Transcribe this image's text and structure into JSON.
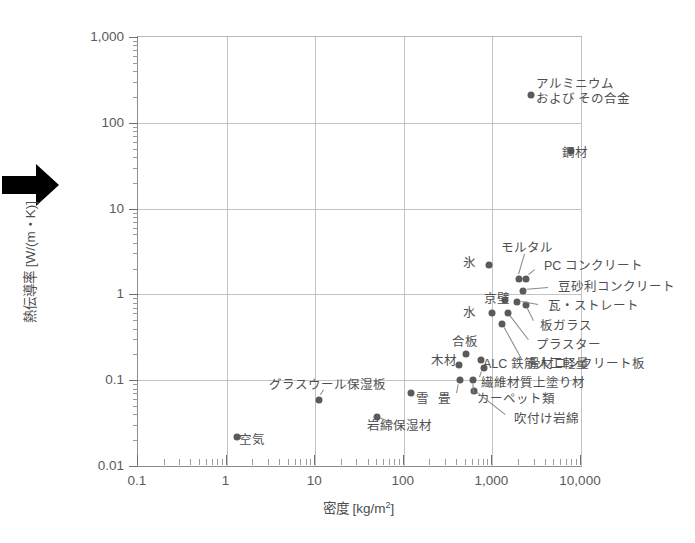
{
  "figure": {
    "arrow_icon": "right-arrow-marker"
  },
  "chart_data": {
    "type": "scatter",
    "title": "",
    "xlabel": "密度 [kg/m2]",
    "xlabel_base": "密度 [kg/m",
    "xlabel_sup": "2",
    "xlabel_tail": "]",
    "ylabel": "熱伝導率 [W/(m・K)]",
    "xscale": "log",
    "yscale": "log",
    "xlim": [
      0.1,
      10000
    ],
    "ylim": [
      0.01,
      1000
    ],
    "grid": true,
    "legend": "none",
    "xticks": [
      "0.1",
      "1",
      "10",
      "100",
      "1,000",
      "10,000"
    ],
    "xtick_values": [
      0.1,
      1,
      10,
      100,
      1000,
      10000
    ],
    "yticks": [
      "1,000",
      "100",
      "10",
      "1",
      "0.1",
      "0.01"
    ],
    "ytick_values": [
      1000,
      100,
      10,
      1,
      0.1,
      0.01
    ],
    "points": [
      {
        "label": "アルミニウムおよびその合金",
        "label2": "および その合金",
        "x": 2700,
        "y": 210,
        "lx": 536,
        "ly": 92,
        "anchor": "right",
        "lines": [
          "アルミニウム",
          "および その合金"
        ]
      },
      {
        "label": "鋼材",
        "x": 7800,
        "y": 47,
        "lx": 562,
        "ly": 153,
        "anchor": "right",
        "lines": [
          "鋼材"
        ]
      },
      {
        "label": "氷",
        "x": 920,
        "y": 2.2,
        "lx": 476,
        "ly": 263,
        "anchor": "left",
        "lines": [
          "氷"
        ]
      },
      {
        "label": "モルタル",
        "x": 2000,
        "y": 1.5,
        "lx": 527,
        "ly": 248,
        "anchor": "center",
        "lines": [
          "モルタル"
        ]
      },
      {
        "label": "PC コンクリート",
        "x": 2400,
        "y": 1.5,
        "lx": 544,
        "ly": 266,
        "anchor": "right",
        "lines": [
          "PC コンクリート"
        ]
      },
      {
        "label": "豆砂利コンクリート",
        "x": 2200,
        "y": 1.1,
        "lx": 558,
        "ly": 287,
        "anchor": "right",
        "lines": [
          "豆砂利コンクリート"
        ]
      },
      {
        "label": "京壁",
        "x": 1400,
        "y": 0.85,
        "lx": 510,
        "ly": 299,
        "anchor": "left",
        "lines": [
          "京壁"
        ]
      },
      {
        "label": "瓦・ストレート",
        "x": 1900,
        "y": 0.82,
        "lx": 548,
        "ly": 306,
        "anchor": "right",
        "lines": [
          "瓦・ストレート"
        ]
      },
      {
        "label": "板ガラス",
        "x": 2400,
        "y": 0.76,
        "lx": 540,
        "ly": 326,
        "anchor": "right",
        "lines": [
          "板ガラス"
        ]
      },
      {
        "label": "水",
        "x": 1000,
        "y": 0.6,
        "lx": 476,
        "ly": 313,
        "anchor": "left",
        "lines": [
          "水"
        ]
      },
      {
        "label": "プラスター",
        "x": 1500,
        "y": 0.6,
        "lx": 536,
        "ly": 345,
        "anchor": "right",
        "lines": [
          "プラスター"
        ]
      },
      {
        "label": "骨材コンクリート板",
        "x": 1300,
        "y": 0.45,
        "lx": 528,
        "ly": 364,
        "anchor": "right",
        "lines": [
          "骨材コンクリート板"
        ]
      },
      {
        "label": "合板",
        "x": 500,
        "y": 0.2,
        "lx": 465,
        "ly": 342,
        "anchor": "center",
        "lines": [
          "合板"
        ]
      },
      {
        "label": "木材",
        "x": 420,
        "y": 0.15,
        "lx": 444,
        "ly": 361,
        "anchor": "center",
        "lines": [
          "木材"
        ]
      },
      {
        "label": "ALC 鉄筋人工軽量",
        "x": 750,
        "y": 0.17,
        "lx": 483,
        "ly": 364,
        "anchor": "right",
        "lines": [
          "ALC 鉄筋人工軽量"
        ]
      },
      {
        "label": "繊維材質上塗り材",
        "x": 800,
        "y": 0.14,
        "lx": 481,
        "ly": 383,
        "anchor": "right",
        "lines": [
          "繊維材質上塗り材"
        ]
      },
      {
        "label": "カーペット類",
        "x": 600,
        "y": 0.1,
        "lx": 477,
        "ly": 399,
        "anchor": "right",
        "lines": [
          "カーペット類"
        ]
      },
      {
        "label": "畳",
        "x": 430,
        "y": 0.1,
        "lx": 451,
        "ly": 399,
        "anchor": "left",
        "lines": [
          "畳"
        ]
      },
      {
        "label": "吹付け岩綿",
        "x": 620,
        "y": 0.075,
        "lx": 514,
        "ly": 419,
        "anchor": "right",
        "lines": [
          "吹付け岩綿"
        ]
      },
      {
        "label": "雪",
        "x": 120,
        "y": 0.07,
        "lx": 416,
        "ly": 399,
        "anchor": "right",
        "lines": [
          "雪"
        ]
      },
      {
        "label": "グラスウール保湿板",
        "x": 11,
        "y": 0.058,
        "lx": 327,
        "ly": 385,
        "anchor": "center",
        "lines": [
          "グラスウール保湿板"
        ]
      },
      {
        "label": "岩綿保湿材",
        "x": 50,
        "y": 0.037,
        "lx": 399,
        "ly": 426,
        "anchor": "center",
        "lines": [
          "岩綿保湿材"
        ]
      },
      {
        "label": "空気",
        "x": 1.3,
        "y": 0.022,
        "lx": 239,
        "ly": 440,
        "anchor": "right",
        "lines": [
          "空気"
        ]
      }
    ]
  }
}
